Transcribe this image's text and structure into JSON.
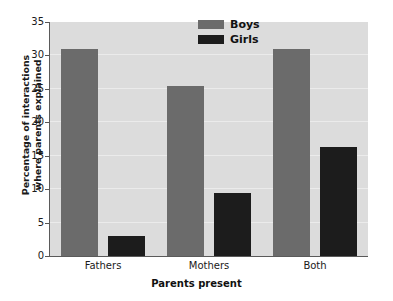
{
  "chart_data": {
    "type": "bar",
    "title": "",
    "subtitle": "",
    "xlabel": "Parents present",
    "ylabel": "Percentage of interactions where parents explained",
    "ylabel_line1": "Percentage of interactions",
    "ylabel_line2": "where parents explained",
    "categories": [
      "Fathers",
      "Mothers",
      "Both"
    ],
    "series": [
      {
        "name": "Boys",
        "color": "#6b6b6b",
        "values": [
          30.9,
          25.4,
          31.0
        ]
      },
      {
        "name": "Girls",
        "color": "#1c1c1c",
        "values": [
          3.0,
          9.4,
          16.3
        ]
      }
    ],
    "ylim": [
      0,
      35
    ],
    "yticks": [
      0,
      5,
      10,
      15,
      20,
      25,
      30,
      35
    ],
    "ytick_labels": [
      "0",
      "5",
      "10",
      "15",
      "20",
      "25",
      "30",
      "35"
    ],
    "grid": true,
    "grid_axis": "y",
    "legend_position": "top-center",
    "plot_background": "#dcdcdc",
    "figure_background": "#ffffff"
  },
  "legend": {
    "entries": [
      {
        "label": "Boys",
        "color": "#6b6b6b"
      },
      {
        "label": "Girls",
        "color": "#1c1c1c"
      }
    ]
  }
}
